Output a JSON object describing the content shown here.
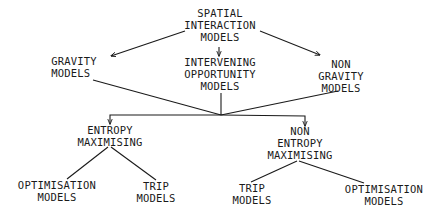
{
  "diagram": {
    "type": "hierarchy",
    "colors": {
      "background": "#ffffff",
      "ink": "#1a1a1a"
    },
    "nodes": {
      "root": {
        "lines": [
          "SPATIAL",
          "INTERACTION",
          "MODELS"
        ]
      },
      "gravity": {
        "lines": [
          "GRAVITY",
          "MODELS"
        ]
      },
      "intervening": {
        "lines": [
          "INTERVENING",
          "OPPORTUNITY",
          "MODELS"
        ]
      },
      "non_gravity": {
        "lines": [
          "NON",
          "GRAVITY",
          "MODELS"
        ]
      },
      "entropy": {
        "lines": [
          "ENTROPY",
          "MAXIMISING"
        ]
      },
      "non_entropy": {
        "lines": [
          "NON",
          "ENTROPY",
          "MAXIMISING"
        ]
      },
      "entropy_optimisation": {
        "lines": [
          "OPTIMISATION",
          "MODELS"
        ]
      },
      "entropy_trip": {
        "lines": [
          "TRIP",
          "MODELS"
        ]
      },
      "non_entropy_trip": {
        "lines": [
          "TRIP",
          "MODELS"
        ]
      },
      "non_entropy_optimisation": {
        "lines": [
          "OPTIMISATION",
          "MODELS"
        ]
      }
    },
    "edges": [
      {
        "from": "root",
        "to": "gravity",
        "arrow": true
      },
      {
        "from": "root",
        "to": "intervening",
        "arrow": true
      },
      {
        "from": "root",
        "to": "non_gravity",
        "arrow": true
      },
      {
        "from": "gravity",
        "to": "junction",
        "arrow": false
      },
      {
        "from": "intervening",
        "to": "junction",
        "arrow": false
      },
      {
        "from": "non_gravity",
        "to": "junction",
        "arrow": false
      },
      {
        "from": "junction",
        "to": "entropy",
        "arrow": true
      },
      {
        "from": "junction",
        "to": "non_entropy",
        "arrow": true
      },
      {
        "from": "entropy",
        "to": "entropy_optimisation",
        "arrow": false
      },
      {
        "from": "entropy",
        "to": "entropy_trip",
        "arrow": false
      },
      {
        "from": "non_entropy",
        "to": "non_entropy_trip",
        "arrow": false
      },
      {
        "from": "non_entropy",
        "to": "non_entropy_optimisation",
        "arrow": false
      }
    ]
  }
}
